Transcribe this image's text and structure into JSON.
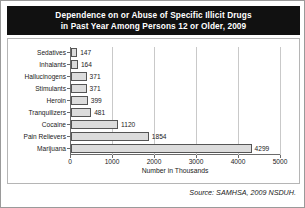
{
  "title": {
    "line1": "Dependence on or Abuse of Specific Illicit Drugs",
    "line2": "in Past Year Among Persons 12 or Older, 2009"
  },
  "source": "Source: SAMHSA, 2009 NSDUH.",
  "chart_data": {
    "type": "bar",
    "orientation": "horizontal",
    "title": "Dependence on or Abuse of Specific Illicit Drugs in Past Year Among Persons 12 or Older, 2009",
    "categories": [
      "Sedatives",
      "Inhalants",
      "Hallucinogens",
      "Stimulants",
      "Heroin",
      "Tranquilizers",
      "Cocaine",
      "Pain Relievers",
      "Marijuana"
    ],
    "values": [
      147,
      164,
      371,
      371,
      399,
      481,
      1120,
      1854,
      4299
    ],
    "data_labels": [
      "147",
      "164",
      "371",
      "371",
      "399",
      "481",
      "1120",
      "1854",
      "4299"
    ],
    "xlabel": "Number in Thousands",
    "ylabel": "",
    "xlim": [
      0,
      5000
    ],
    "xticks": [
      0,
      1000,
      2000,
      3000,
      4000,
      5000
    ],
    "xtick_labels": [
      "0",
      "1000",
      "2000",
      "3000",
      "4000",
      "5000"
    ],
    "grid": true,
    "legend": false,
    "bar_color": "#dcdcdc",
    "bar_border_color": "#555555",
    "title_background": "#111111",
    "title_color": "#ffffff"
  }
}
